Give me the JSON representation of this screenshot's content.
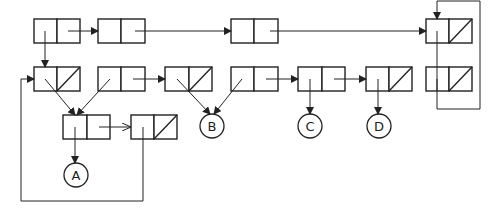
{
  "diagram": {
    "title": "",
    "type": "list-structure-box-and-pointer",
    "nodes": {
      "A": {
        "label": "A"
      },
      "B": {
        "label": "B"
      },
      "C": {
        "label": "C"
      },
      "D": {
        "label": "D"
      }
    },
    "cells": [
      {
        "id": "r1c1",
        "row": 1,
        "nil_cdr": false
      },
      {
        "id": "r1c2",
        "row": 1,
        "nil_cdr": false
      },
      {
        "id": "r1c3",
        "row": 1,
        "nil_cdr": false
      },
      {
        "id": "r1c4",
        "row": 1,
        "nil_cdr": true
      },
      {
        "id": "r2c1",
        "row": 2,
        "nil_cdr": true
      },
      {
        "id": "r2c2",
        "row": 2,
        "nil_cdr": false
      },
      {
        "id": "r2c3",
        "row": 2,
        "nil_cdr": true
      },
      {
        "id": "r2c4",
        "row": 2,
        "nil_cdr": false
      },
      {
        "id": "r2c5",
        "row": 2,
        "nil_cdr": false
      },
      {
        "id": "r2c6",
        "row": 2,
        "nil_cdr": true
      },
      {
        "id": "r2c7",
        "row": 2,
        "nil_cdr": true
      },
      {
        "id": "r3c1",
        "row": 3,
        "nil_cdr": false
      },
      {
        "id": "r3c2",
        "row": 3,
        "nil_cdr": true
      }
    ],
    "colors": {
      "stroke": "#222222",
      "background": "#ffffff"
    }
  }
}
